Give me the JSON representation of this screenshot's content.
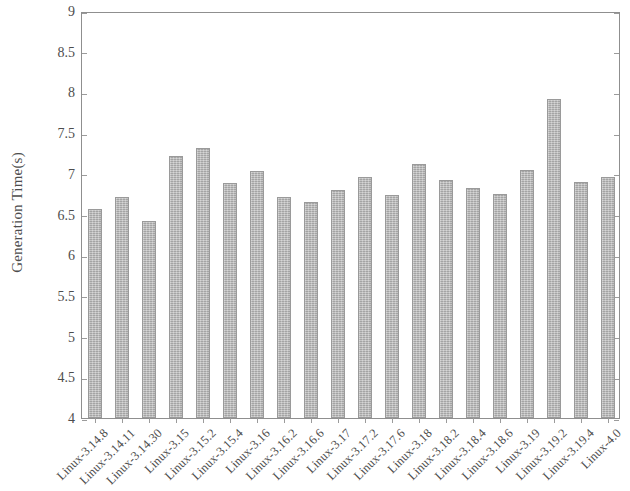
{
  "chart_data": {
    "type": "bar",
    "title": "",
    "subtitle": "",
    "xlabel": "",
    "ylabel": "Generation Time(s)",
    "ylim": [
      4,
      9
    ],
    "xlim_note": "categorical",
    "grid": false,
    "legend": null,
    "legend_position": "none",
    "y_ticks": [
      "4",
      "4.5",
      "5",
      "5.5",
      "6",
      "6.5",
      "7",
      "7.5",
      "8",
      "8.5",
      "9"
    ],
    "y_tick_values": [
      4,
      4.5,
      5,
      5.5,
      6,
      6.5,
      7,
      7.5,
      8,
      8.5,
      9
    ],
    "y_tick_interval": 0.5,
    "bar_color": "#b4b4b4",
    "bar_edge_color": "#9a9a9a",
    "axis_color": "#8f8f8f",
    "text_color": "#4d4d4d",
    "background": "#ffffff",
    "categories": [
      "Linux-3.14.8",
      "Linux-3.14.11",
      "Linux-3.14.30",
      "Linux-3.15",
      "Linux-3.15.2",
      "Linux-3.15.4",
      "Linux-3.16",
      "Linux-3.16.2",
      "Linux-3.16.6",
      "Linux-3.17",
      "Linux-3.17.2",
      "Linux-3.17.6",
      "Linux-3.18",
      "Linux-3.18.2",
      "Linux-3.18.4",
      "Linux-3.18.6",
      "Linux-3.19",
      "Linux-3.19.2",
      "Linux-3.19.4",
      "Linux-4.0"
    ],
    "values": [
      6.57,
      6.72,
      6.42,
      7.22,
      7.32,
      6.89,
      7.04,
      6.72,
      6.65,
      6.8,
      6.96,
      6.74,
      7.12,
      6.93,
      6.82,
      6.75,
      7.05,
      7.92,
      6.9,
      6.96
    ]
  }
}
